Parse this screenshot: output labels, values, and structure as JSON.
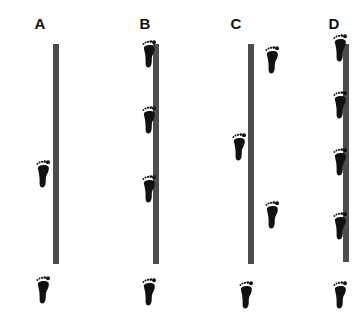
{
  "figure": {
    "colors": {
      "wall": "#4d4d4d",
      "footprint": "#111111",
      "label": "#111111",
      "background": "#ffffff"
    },
    "panels": [
      {
        "label": "A",
        "label_x": 40,
        "wall": {
          "x": 56,
          "top": 44,
          "bottom": 264
        },
        "footprints": [
          {
            "x": 34,
            "y": 160
          },
          {
            "x": 34,
            "y": 276
          }
        ]
      },
      {
        "label": "B",
        "label_x": 145,
        "wall": {
          "x": 156,
          "top": 44,
          "bottom": 264
        },
        "footprints": [
          {
            "x": 140,
            "y": 40
          },
          {
            "x": 140,
            "y": 106
          },
          {
            "x": 140,
            "y": 175
          },
          {
            "x": 140,
            "y": 278
          }
        ]
      },
      {
        "label": "C",
        "label_x": 236,
        "wall": {
          "x": 251,
          "top": 44,
          "bottom": 264
        },
        "footprints": [
          {
            "x": 263,
            "y": 46
          },
          {
            "x": 230,
            "y": 133
          },
          {
            "x": 263,
            "y": 201
          },
          {
            "x": 237,
            "y": 281
          }
        ]
      },
      {
        "label": "D",
        "label_x": 334,
        "wall": {
          "x": 346,
          "top": 44,
          "bottom": 262
        },
        "footprints": [
          {
            "x": 331,
            "y": 34
          },
          {
            "x": 331,
            "y": 91
          },
          {
            "x": 331,
            "y": 148
          },
          {
            "x": 331,
            "y": 212
          },
          {
            "x": 331,
            "y": 281
          }
        ]
      }
    ]
  }
}
